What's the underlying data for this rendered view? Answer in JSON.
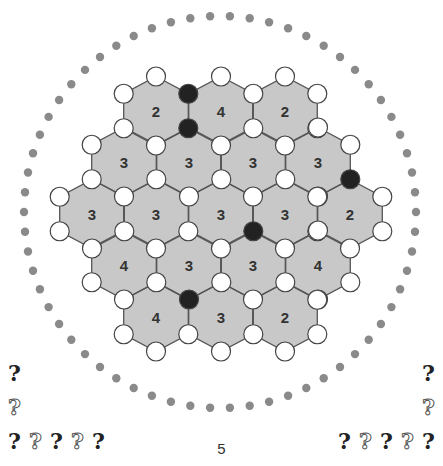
{
  "puzzle": {
    "type": "hex-vertex-puzzle",
    "page_number": "5",
    "colors": {
      "hex_fill": "#c8c8c8",
      "hex_stroke": "#555555",
      "vertex_empty": "#ffffff",
      "vertex_filled": "#222222",
      "ring_dot": "#8a8a8a"
    },
    "geometry": {
      "hx": 32.3,
      "hy": 34.5,
      "vertex_r": 9.5
    },
    "hexes": [
      {
        "row": 0,
        "cx": 156,
        "cy": 111,
        "label": "2"
      },
      {
        "row": 0,
        "cx": 221,
        "cy": 111,
        "label": "4"
      },
      {
        "row": 0,
        "cx": 285,
        "cy": 111,
        "label": "2"
      },
      {
        "row": 1,
        "cx": 124,
        "cy": 162,
        "label": "3"
      },
      {
        "row": 1,
        "cx": 189,
        "cy": 162,
        "label": "3"
      },
      {
        "row": 1,
        "cx": 253,
        "cy": 162,
        "label": "3"
      },
      {
        "row": 1,
        "cx": 318,
        "cy": 162,
        "label": "3"
      },
      {
        "row": 2,
        "cx": 92,
        "cy": 214,
        "label": "3"
      },
      {
        "row": 2,
        "cx": 156,
        "cy": 214,
        "label": "3"
      },
      {
        "row": 2,
        "cx": 221,
        "cy": 214,
        "label": "3"
      },
      {
        "row": 2,
        "cx": 285,
        "cy": 214,
        "label": "3"
      },
      {
        "row": 2,
        "cx": 350,
        "cy": 214,
        "label": "2"
      },
      {
        "row": 3,
        "cx": 124,
        "cy": 265,
        "label": "4"
      },
      {
        "row": 3,
        "cx": 189,
        "cy": 265,
        "label": "3"
      },
      {
        "row": 3,
        "cx": 253,
        "cy": 265,
        "label": "3"
      },
      {
        "row": 3,
        "cx": 318,
        "cy": 265,
        "label": "4"
      },
      {
        "row": 4,
        "cx": 156,
        "cy": 317,
        "label": "4"
      },
      {
        "row": 4,
        "cx": 221,
        "cy": 317,
        "label": "3"
      },
      {
        "row": 4,
        "cx": 285,
        "cy": 317,
        "label": "2"
      }
    ],
    "filled_vertices": [
      {
        "x": 188,
        "y": 94
      },
      {
        "x": 188,
        "y": 128
      },
      {
        "x": 350,
        "y": 180
      },
      {
        "x": 253,
        "y": 231
      },
      {
        "x": 188,
        "y": 299
      }
    ],
    "ring": {
      "cx": 220,
      "cy": 212,
      "r": 196,
      "dots": 62,
      "dot_r": 4.2
    }
  },
  "hints": {
    "left_column": [
      "filled",
      "hollow"
    ],
    "left_row": [
      "filled",
      "hollow",
      "filled",
      "hollow",
      "filled"
    ],
    "right_column": [
      "filled",
      "hollow"
    ],
    "right_row": [
      "filled",
      "hollow",
      "filled",
      "hollow",
      "filled"
    ],
    "glyph": "?"
  }
}
